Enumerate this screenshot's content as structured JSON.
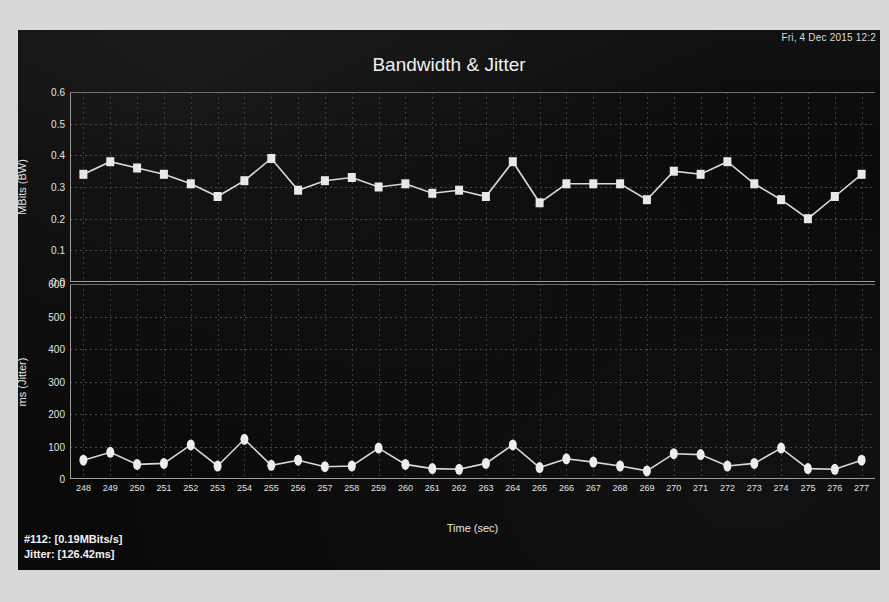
{
  "window": {
    "timestamp": "Fri, 4 Dec 2015 12:2",
    "title": "Bandwidth & Jitter",
    "background_color": "#0a0a0a",
    "series_color": "#e8e8e8"
  },
  "status": {
    "bandwidth_line": "#112: [0.19MBits/s]",
    "jitter_line": "Jitter: [126.42ms]"
  },
  "chart_data": [
    {
      "type": "line",
      "title": "Bandwidth & Jitter",
      "name": "Bandwidth",
      "xlabel": "",
      "ylabel": "MBits (BW)",
      "ylim": [
        0.0,
        0.6
      ],
      "yticks": [
        "0.0",
        "0.1",
        "0.2",
        "0.3",
        "0.4",
        "0.5",
        "0.6"
      ],
      "grid": true,
      "marker": "square",
      "x": [
        248,
        249,
        250,
        251,
        252,
        253,
        254,
        255,
        256,
        257,
        258,
        259,
        260,
        261,
        262,
        263,
        264,
        265,
        266,
        267,
        268,
        269,
        270,
        271,
        272,
        273,
        274,
        275,
        276,
        277
      ],
      "values": [
        0.34,
        0.38,
        0.36,
        0.34,
        0.31,
        0.27,
        0.32,
        0.39,
        0.29,
        0.32,
        0.33,
        0.3,
        0.31,
        0.28,
        0.29,
        0.27,
        0.38,
        0.25,
        0.31,
        0.31,
        0.31,
        0.26,
        0.35,
        0.34,
        0.38,
        0.31,
        0.26,
        0.2,
        0.27,
        0.34
      ]
    },
    {
      "type": "line",
      "name": "Jitter",
      "xlabel": "Time (sec)",
      "ylabel": "ms (Jitter)",
      "ylim": [
        0,
        600
      ],
      "yticks": [
        "0",
        "100",
        "200",
        "300",
        "400",
        "500",
        "600"
      ],
      "grid": true,
      "marker": "ellipse",
      "x": [
        248,
        249,
        250,
        251,
        252,
        253,
        254,
        255,
        256,
        257,
        258,
        259,
        260,
        261,
        262,
        263,
        264,
        265,
        266,
        267,
        268,
        269,
        270,
        271,
        272,
        273,
        274,
        275,
        276,
        277
      ],
      "values": [
        58,
        82,
        45,
        48,
        105,
        40,
        122,
        42,
        58,
        38,
        40,
        95,
        45,
        32,
        30,
        48,
        105,
        35,
        62,
        52,
        40,
        25,
        78,
        75,
        40,
        48,
        95,
        32,
        30,
        58
      ],
      "xticks": [
        "248",
        "249",
        "250",
        "251",
        "252",
        "253",
        "254",
        "255",
        "256",
        "257",
        "258",
        "259",
        "260",
        "261",
        "262",
        "263",
        "264",
        "265",
        "266",
        "267",
        "268",
        "269",
        "270",
        "271",
        "272",
        "273",
        "274",
        "275",
        "276",
        "277"
      ]
    }
  ]
}
